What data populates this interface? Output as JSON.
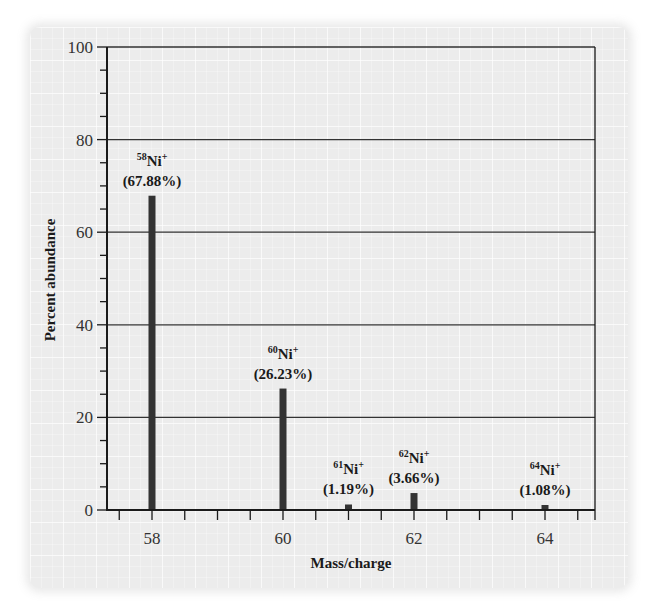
{
  "chart_data": {
    "type": "bar",
    "title": "",
    "xlabel": "Mass/charge",
    "ylabel": "Percent abundance",
    "xlim": [
      57,
      65.5
    ],
    "ylim": [
      0,
      100
    ],
    "x_ticks_major": [
      58,
      60,
      62,
      64
    ],
    "x_tick_labels": [
      "58",
      "60",
      "62",
      "64"
    ],
    "x_ticks_minor_step": 0.5,
    "y_ticks_major": [
      0,
      20,
      40,
      60,
      80,
      100
    ],
    "y_tick_labels": [
      "0",
      "20",
      "40",
      "60",
      "80",
      "100"
    ],
    "y_ticks_minor_step": 5,
    "grid": "horizontal lines at major y ticks",
    "legend": null,
    "categories": [
      "58",
      "60",
      "61",
      "62",
      "64"
    ],
    "x": [
      58,
      60,
      61,
      62,
      64
    ],
    "values": [
      67.88,
      26.23,
      1.19,
      3.66,
      1.08
    ],
    "series": [
      {
        "name": "Ni isotopes",
        "points": [
          {
            "x": 58,
            "y": 67.88,
            "isotope_mass": "58",
            "ion": "Ni",
            "charge": "+",
            "label": "(67.88%)"
          },
          {
            "x": 60,
            "y": 26.23,
            "isotope_mass": "60",
            "ion": "Ni",
            "charge": "+",
            "label": "(26.23%)"
          },
          {
            "x": 61,
            "y": 1.19,
            "isotope_mass": "61",
            "ion": "Ni",
            "charge": "+",
            "label": "(1.19%)"
          },
          {
            "x": 62,
            "y": 3.66,
            "isotope_mass": "62",
            "ion": "Ni",
            "charge": "+",
            "label": "(3.66%)"
          },
          {
            "x": 64,
            "y": 1.08,
            "isotope_mass": "64",
            "ion": "Ni",
            "charge": "+",
            "label": "(1.08%)"
          }
        ]
      }
    ]
  },
  "colors": {
    "bar": "#333333",
    "axis": "#1a1a1a",
    "gridline": "#333333",
    "panel_background": "#ececec"
  }
}
